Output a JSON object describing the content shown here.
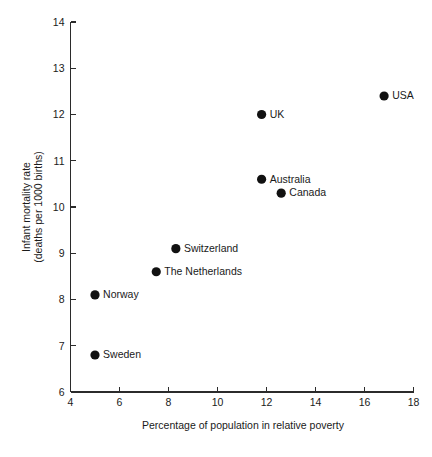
{
  "chart_data": {
    "type": "scatter",
    "title": "",
    "xlabel": "Percentage of population in relative poverty",
    "ylabel_line1": "Infant mortality rate",
    "ylabel_line2": "(deaths per 1000 births)",
    "xlim": [
      4,
      18
    ],
    "ylim": [
      6,
      14
    ],
    "xticks": [
      4,
      6,
      8,
      10,
      12,
      14,
      16,
      18
    ],
    "yticks": [
      6,
      7,
      8,
      9,
      10,
      11,
      12,
      13,
      14
    ],
    "xtick_labels": [
      "4",
      "6",
      "8",
      "10",
      "12",
      "14",
      "16",
      "18"
    ],
    "ytick_labels": [
      "6",
      "7",
      "8",
      "9",
      "10",
      "11",
      "12",
      "13",
      "14"
    ],
    "grid": false,
    "legend": "none",
    "marker_color": "#111111",
    "axis_color": "#2b2b2b",
    "points": [
      {
        "label": "USA",
        "x": 16.8,
        "y": 12.4,
        "label_side": "right"
      },
      {
        "label": "UK",
        "x": 11.8,
        "y": 12.0,
        "label_side": "right"
      },
      {
        "label": "Australia",
        "x": 11.8,
        "y": 10.6,
        "label_side": "right"
      },
      {
        "label": "Canada",
        "x": 12.6,
        "y": 10.3,
        "label_side": "right"
      },
      {
        "label": "Switzerland",
        "x": 8.3,
        "y": 9.1,
        "label_side": "right"
      },
      {
        "label": "The Netherlands",
        "x": 7.5,
        "y": 8.6,
        "label_side": "right"
      },
      {
        "label": "Norway",
        "x": 5.0,
        "y": 8.1,
        "label_side": "right"
      },
      {
        "label": "Sweden",
        "x": 5.0,
        "y": 6.8,
        "label_side": "right"
      }
    ]
  }
}
